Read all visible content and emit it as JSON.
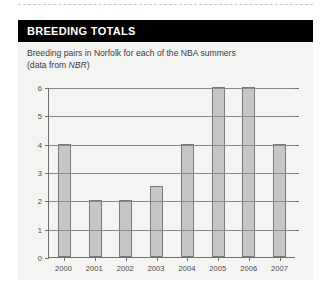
{
  "panel": {
    "header_title": "BREEDING TOTALS",
    "subtitle_line1": "Breeding pairs in Norfolk for each of the NBA summers",
    "subtitle_line2_pre": "(data from ",
    "subtitle_line2_em": "NBR",
    "subtitle_line2_post": ")"
  },
  "colors": {
    "header_background": "#000000",
    "header_text": "#ffffff",
    "panel_background": "#f4f4f3",
    "bar_fill": "#c6c6c6",
    "bar_stroke": "#7a7a7a",
    "axis": "#6f6f6f",
    "gridline": "#8a8a8a"
  },
  "chart_data": {
    "type": "bar",
    "title": "Breeding pairs in Norfolk for each of the NBA summers",
    "xlabel": "",
    "ylabel": "",
    "ylim": [
      0,
      6
    ],
    "ytick_values": [
      0,
      1,
      2,
      3,
      4,
      5,
      6
    ],
    "ytick_labels": [
      "0",
      "1",
      "2",
      "3",
      "4",
      "5",
      "6"
    ],
    "grid": true,
    "legend": "none",
    "categories": [
      "2000",
      "2001",
      "2002",
      "2003",
      "2004",
      "2005",
      "2006",
      "2007"
    ],
    "values": [
      4,
      2,
      2,
      2.5,
      4,
      6,
      6,
      4
    ]
  }
}
